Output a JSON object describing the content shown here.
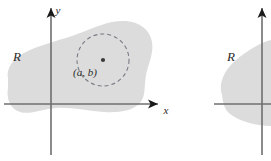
{
  "figure": {
    "type": "math-diagram",
    "background_color": "#ffffff",
    "region_fill_color": "#dcdcdc",
    "axis_color": "#6f6f6f",
    "arrow_color": "#1a1a1a",
    "dash_color": "#7a7a86",
    "point_color": "#3a3a3a",
    "panels": [
      {
        "id": "left-panel",
        "region_label": "R",
        "x_axis_label": "x",
        "y_axis_label": "y",
        "point_label": "(a, b)",
        "has_dashed_circle": true,
        "origin": {
          "x": 51,
          "y": 104
        },
        "x_axis": {
          "x1": 4,
          "y1": 104,
          "x2": 158,
          "y2": 104
        },
        "y_axis": {
          "x1": 51,
          "y1": 155,
          "x2": 51,
          "y2": 8
        },
        "circle": {
          "cx": 103,
          "cy": 60,
          "r": 26
        },
        "center_point": {
          "cx": 103,
          "cy": 60,
          "r": 2.1
        },
        "region_path": "M 8 78 C 6 66 16 56 30 50 C 46 43 62 40 80 33 C 96 27 110 20 126 21 C 140 22 150 30 152 42 C 154 54 148 64 146 75 C 144 86 146 96 140 103 C 133 111 118 113 104 112 C 88 111 72 107 56 108 C 42 109 30 115 20 112 C 10 109 6 98 8 88 Z",
        "label_positions": {
          "region": {
            "x": 17,
            "y": 61
          },
          "x_axis": {
            "x": 166,
            "y": 114
          },
          "y_axis": {
            "x": 58,
            "y": 14
          },
          "point": {
            "x": 85,
            "y": 76
          }
        }
      },
      {
        "id": "right-panel",
        "region_label": "R",
        "has_dashed_circle": false,
        "origin": {
          "x": 262,
          "y": 104
        },
        "x_axis": {
          "x1": 214,
          "y1": 104,
          "x2": 271,
          "y2": 104
        },
        "y_axis": {
          "x1": 262,
          "y1": 155,
          "x2": 262,
          "y2": 8
        },
        "region_path": "M 222 95 C 218 84 224 70 236 60 C 248 50 262 42 271 40 L 271 126 C 258 126 240 122 230 114 C 224 109 223 102 222 95 Z",
        "label_positions": {
          "region": {
            "x": 231,
            "y": 61
          }
        }
      }
    ]
  }
}
